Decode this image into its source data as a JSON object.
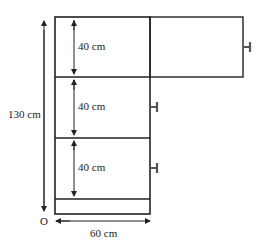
{
  "diagram": {
    "labels": {
      "total_height": "130 cm",
      "compartment_1": "40 cm",
      "compartment_2": "40 cm",
      "compartment_3": "40 cm",
      "width": "60 cm",
      "origin": "O"
    },
    "colors": {
      "stroke": "#222222",
      "handle": "#555555",
      "background": "#ffffff"
    }
  }
}
